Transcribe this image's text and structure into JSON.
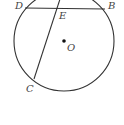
{
  "diagram": {
    "type": "circle-geometry",
    "colors": {
      "stroke": "#333333",
      "label": "#444444",
      "background": "#ffffff"
    },
    "circle": {
      "center_label": "O",
      "cx": 64,
      "cy": 41,
      "r": 50
    },
    "points": {
      "D": {
        "label": "D",
        "x": 25,
        "y": 8
      },
      "B": {
        "label": "B",
        "x": 105,
        "y": 9
      },
      "E": {
        "label": "E",
        "x": 58,
        "y": 9
      },
      "C": {
        "label": "C",
        "x": 34,
        "y": 79
      },
      "O": {
        "label": "O",
        "x": 64,
        "y": 41
      }
    },
    "segments": [
      {
        "name": "chord-DB",
        "from": "D",
        "to": "B"
      },
      {
        "name": "chord-through-E-to-C",
        "from": "top",
        "to": "C"
      }
    ]
  }
}
